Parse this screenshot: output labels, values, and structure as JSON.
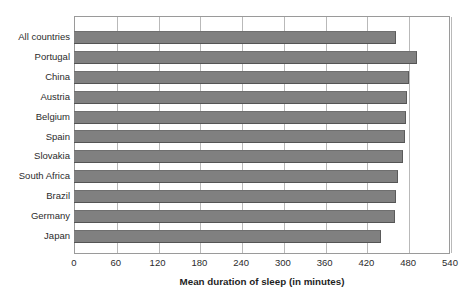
{
  "chart_data": {
    "type": "bar",
    "orientation": "horizontal",
    "title": "",
    "xlabel": "Mean duration of sleep (in minutes)",
    "ylabel": "",
    "xlim": [
      0,
      540
    ],
    "xticks": [
      0,
      60,
      120,
      180,
      240,
      300,
      360,
      420,
      480,
      540
    ],
    "grid": true,
    "legend": false,
    "bar_color": "#808080",
    "categories": [
      "All countries",
      "Portugal",
      "China",
      "Austria",
      "Belgium",
      "Spain",
      "Slovakia",
      "South Africa",
      "Brazil",
      "Germany",
      "Japan"
    ],
    "values": [
      463,
      492,
      481,
      478,
      477,
      476,
      472,
      466,
      463,
      461,
      441
    ]
  }
}
